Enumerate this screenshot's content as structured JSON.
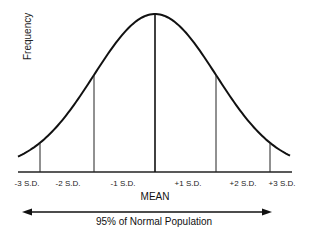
{
  "chart_data": {
    "type": "line",
    "title": "",
    "xlabel": "MEAN",
    "ylabel": "Frequency",
    "grid": false,
    "tick_labels": [
      "-3 S.D.",
      "-2 S.D.",
      "-1 S.D.",
      "+1 S.D.",
      "+2 S.D.",
      "+3 S.D."
    ],
    "sd_positions": [
      -3,
      -2,
      -1,
      1,
      2,
      3
    ],
    "markers": [
      {
        "sd": -3,
        "line": true
      },
      {
        "sd": -2,
        "line": false
      },
      {
        "sd": -1,
        "line": true
      },
      {
        "sd": 0,
        "line": true,
        "label": "MEAN"
      },
      {
        "sd": 1,
        "line": true
      },
      {
        "sd": 2,
        "line": false
      },
      {
        "sd": 3,
        "line": true
      }
    ],
    "annotation": "95% of Normal Population",
    "annotation_type": "double-headed arrow spanning approx -2 S.D. to +2 S.D."
  },
  "labels": {
    "ylabel": "Frequency",
    "mean": "MEAN",
    "range": "95% of Normal Population",
    "ticks": [
      "-3 S.D.",
      "-2 S.D.",
      "-1 S.D.",
      "+1 S.D.",
      "+2 S.D.",
      "+3 S.D."
    ]
  }
}
